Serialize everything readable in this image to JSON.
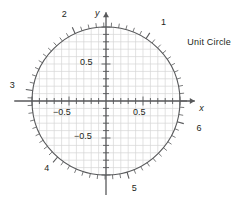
{
  "figure": {
    "caption": "Unit Circle",
    "axis_labels": {
      "x": "x",
      "y": "y"
    }
  },
  "chart_data": {
    "type": "scatter",
    "title": "Unit Circle",
    "xlabel": "x",
    "ylabel": "y",
    "xlim": [
      -1.28,
      1.28
    ],
    "ylim": [
      -1.28,
      1.28
    ],
    "grid": true,
    "grid_step": 0.1,
    "legend": null,
    "circle": {
      "center": [
        0,
        0
      ],
      "radius": 1
    },
    "x_tick_labels": [
      {
        "value": -0.5,
        "text": "−0.5"
      },
      {
        "value": 0.5,
        "text": "0.5"
      }
    ],
    "y_tick_labels": [
      {
        "value": 0.5,
        "text": "0.5"
      },
      {
        "value": -0.5,
        "text": "−0.5"
      }
    ],
    "minor_tick_step_radians": 0.1,
    "radian_markers": [
      {
        "label": "1",
        "radians": 1
      },
      {
        "label": "2",
        "radians": 2
      },
      {
        "label": "3",
        "radians": 3
      },
      {
        "label": "4",
        "radians": 4
      },
      {
        "label": "5",
        "radians": 5
      },
      {
        "label": "6",
        "radians": 6
      }
    ],
    "annotations": [
      {
        "text": "Unit Circle",
        "x": 1.18,
        "y": 0.78
      }
    ]
  },
  "colors": {
    "grid": "#d6d6d6",
    "circle": "#58595b",
    "axis": "#58595b",
    "text": "#231f20",
    "background": "#ffffff"
  }
}
